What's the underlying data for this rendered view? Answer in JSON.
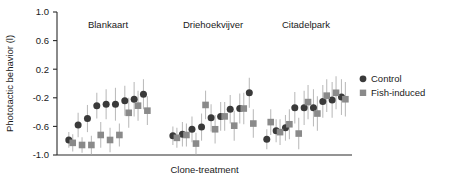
{
  "chart_data": {
    "type": "scatter",
    "title": "",
    "xlabel": "Clone-treatment",
    "ylabel": "Phototactic behavior (l)",
    "ylim": [
      -1.0,
      1.0
    ],
    "yticks": [
      "1.0",
      "0.6",
      "0.2",
      "-0.2",
      "-0.6",
      "-1.0"
    ],
    "ytick_values": [
      1.0,
      0.6,
      0.2,
      -0.2,
      -0.6,
      -1.0
    ],
    "grid": false,
    "xticks_shown": false,
    "legend_position": "right",
    "legend": [
      {
        "name": "Control",
        "marker": "circle",
        "color": "#3a3a3a"
      },
      {
        "name": "Fish-induced",
        "marker": "square",
        "color": "#8a8a8a"
      }
    ],
    "panels": [
      {
        "title": "Blankaart",
        "series": [
          {
            "name": "Control",
            "marker": "circle",
            "color": "#3a3a3a",
            "x": [
              1,
              2,
              3,
              4,
              5,
              6,
              7,
              8,
              9
            ],
            "values": [
              -0.79,
              -0.58,
              -0.49,
              -0.31,
              -0.29,
              -0.29,
              -0.24,
              -0.22,
              -0.15
            ],
            "err_low": [
              -0.9,
              -0.75,
              -0.68,
              -0.49,
              -0.5,
              -0.52,
              -0.45,
              -0.46,
              -0.36
            ],
            "err_high": [
              -0.68,
              -0.41,
              -0.3,
              -0.13,
              -0.08,
              -0.06,
              -0.03,
              0.02,
              0.06
            ]
          },
          {
            "name": "Fish-induced",
            "marker": "square",
            "color": "#8a8a8a",
            "x": [
              1,
              2,
              3,
              4,
              5,
              6,
              7,
              8,
              9
            ],
            "values": [
              -0.83,
              -0.86,
              -0.86,
              -0.72,
              -0.79,
              -0.72,
              -0.41,
              -0.31,
              -0.38
            ],
            "err_low": [
              -0.95,
              -0.97,
              -0.99,
              -0.9,
              -0.96,
              -0.88,
              -0.62,
              -0.52,
              -0.58
            ],
            "err_high": [
              -0.71,
              -0.75,
              -0.73,
              -0.54,
              -0.62,
              -0.56,
              -0.2,
              -0.1,
              -0.18
            ]
          }
        ]
      },
      {
        "title": "Driehoekvijver",
        "series": [
          {
            "name": "Control",
            "marker": "circle",
            "color": "#3a3a3a",
            "x": [
              1,
              2,
              3,
              4,
              5,
              6,
              7,
              8,
              9
            ],
            "values": [
              -0.73,
              -0.71,
              -0.64,
              -0.61,
              -0.48,
              -0.46,
              -0.36,
              -0.35,
              -0.13
            ],
            "err_low": [
              -0.86,
              -0.88,
              -0.82,
              -0.8,
              -0.67,
              -0.66,
              -0.56,
              -0.56,
              -0.34
            ],
            "err_high": [
              -0.6,
              -0.54,
              -0.46,
              -0.42,
              -0.29,
              -0.26,
              -0.16,
              -0.14,
              0.08
            ]
          },
          {
            "name": "Fish-induced",
            "marker": "square",
            "color": "#8a8a8a",
            "x": [
              1,
              2,
              3,
              4,
              5,
              6,
              7,
              8,
              9
            ],
            "values": [
              -0.76,
              -0.72,
              -0.84,
              -0.3,
              -0.64,
              -0.46,
              -0.59,
              -0.35,
              -0.56
            ],
            "err_low": [
              -0.9,
              -0.88,
              -0.99,
              -0.5,
              -0.84,
              -0.66,
              -0.8,
              -0.57,
              -0.76
            ],
            "err_high": [
              -0.62,
              -0.56,
              -0.69,
              -0.1,
              -0.44,
              -0.26,
              -0.38,
              -0.13,
              -0.36
            ]
          }
        ]
      },
      {
        "title": "Citadelpark",
        "series": [
          {
            "name": "Control",
            "marker": "circle",
            "color": "#3a3a3a",
            "x": [
              1,
              2,
              3,
              4,
              5,
              6,
              7,
              8,
              9
            ],
            "values": [
              -0.78,
              -0.66,
              -0.62,
              -0.34,
              -0.34,
              -0.34,
              -0.25,
              -0.23,
              -0.19
            ],
            "err_low": [
              -0.92,
              -0.82,
              -0.8,
              -0.56,
              -0.58,
              -0.6,
              -0.48,
              -0.48,
              -0.44
            ],
            "err_high": [
              -0.64,
              -0.5,
              -0.44,
              -0.12,
              -0.1,
              -0.08,
              -0.02,
              0.02,
              0.06
            ]
          },
          {
            "name": "Fish-induced",
            "marker": "square",
            "color": "#8a8a8a",
            "x": [
              1,
              2,
              3,
              4,
              5,
              6,
              7,
              8,
              9
            ],
            "values": [
              -0.54,
              -0.68,
              -0.57,
              -0.7,
              -0.26,
              -0.42,
              -0.17,
              -0.13,
              -0.22
            ],
            "err_low": [
              -0.72,
              -0.86,
              -0.78,
              -0.92,
              -0.5,
              -0.66,
              -0.4,
              -0.36,
              -0.46
            ],
            "err_high": [
              -0.36,
              -0.5,
              -0.36,
              -0.48,
              -0.02,
              -0.18,
              0.06,
              0.1,
              0.02
            ]
          }
        ]
      }
    ]
  }
}
